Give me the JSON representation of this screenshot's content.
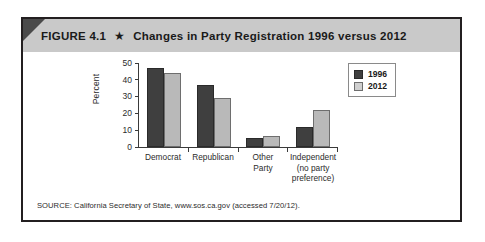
{
  "figure": {
    "number_label": "FIGURE 4.1",
    "star_icon": "star-icon",
    "star_glyph": "★",
    "title": "Changes in Party Registration 1996 versus 2012",
    "source": "SOURCE: California Secretary of State, www.sos.ca.gov (accessed 7/20/12)."
  },
  "colors": {
    "header_band": "#c9c9c9",
    "corner_fold": "#4a4a4a",
    "frame_border": "#231f20",
    "series_1996": "#3f3f3f",
    "series_2012": "#b9b9b9",
    "axis": "#3a3a3a"
  },
  "chart_data": {
    "type": "bar",
    "title": "Changes in Party Registration 1996 versus 2012",
    "xlabel": "",
    "ylabel": "Percent",
    "ylim": [
      0,
      50
    ],
    "yticks": [
      0,
      10,
      20,
      30,
      40,
      50
    ],
    "ytick_labels": [
      "0",
      "10",
      "20",
      "30",
      "40",
      "50"
    ],
    "grid": false,
    "legend_position": "top-right",
    "categories": [
      "Democrat",
      "Republican",
      "Other\nParty",
      "Independent\n(no party\npreference)"
    ],
    "category_lines": [
      [
        "Democrat"
      ],
      [
        "Republican"
      ],
      [
        "Other",
        "Party"
      ],
      [
        "Independent",
        "(no party",
        "preference)"
      ]
    ],
    "series": [
      {
        "name": "1996",
        "color": "#3f3f3f",
        "values": [
          47,
          37,
          5.5,
          12
        ]
      },
      {
        "name": "2012",
        "color": "#b9b9b9",
        "values": [
          44,
          29,
          6.5,
          22
        ]
      }
    ]
  }
}
